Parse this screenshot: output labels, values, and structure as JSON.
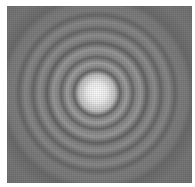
{
  "image": {
    "subject": "Airy diffraction pattern",
    "description": "Bright central disk surrounded by concentric alternating dark and light rings on a textured gray background",
    "canvas": {
      "width": 195,
      "height": 187,
      "background": "#ffffff"
    },
    "pattern_box": {
      "x": 7,
      "y": 6,
      "width": 185,
      "height": 177
    },
    "center": {
      "x": 90,
      "y": 87
    },
    "colors": {
      "core": "#f6f6f6",
      "core_edge": "#d8d8d8",
      "light_ring": "#a2a2a2",
      "dark_ring": "#636363",
      "background": "#7b7b7b"
    },
    "ring_profile": [
      {
        "r": 0,
        "color": "#f8f8f8"
      },
      {
        "r": 10,
        "color": "#ececec"
      },
      {
        "r": 18,
        "color": "#c4c4c4"
      },
      {
        "r": 23,
        "color": "#6a6a6a"
      },
      {
        "r": 26,
        "color": "#8c8c8c"
      },
      {
        "r": 30,
        "color": "#a4a4a4"
      },
      {
        "r": 36,
        "color": "#6c6c6c"
      },
      {
        "r": 39,
        "color": "#8a8a8a"
      },
      {
        "r": 44,
        "color": "#9c9c9c"
      },
      {
        "r": 50,
        "color": "#676767"
      },
      {
        "r": 54,
        "color": "#868686"
      },
      {
        "r": 58,
        "color": "#929292"
      },
      {
        "r": 64,
        "color": "#6b6b6b"
      },
      {
        "r": 68,
        "color": "#848484"
      },
      {
        "r": 72,
        "color": "#8c8c8c"
      },
      {
        "r": 78,
        "color": "#6c6c6c"
      },
      {
        "r": 83,
        "color": "#818181"
      },
      {
        "r": 90,
        "color": "#7e7e7e"
      },
      {
        "r": 96,
        "color": "#6e6e6e"
      },
      {
        "r": 110,
        "color": "#7a7a7a"
      },
      {
        "r": 130,
        "color": "#747474"
      }
    ]
  }
}
